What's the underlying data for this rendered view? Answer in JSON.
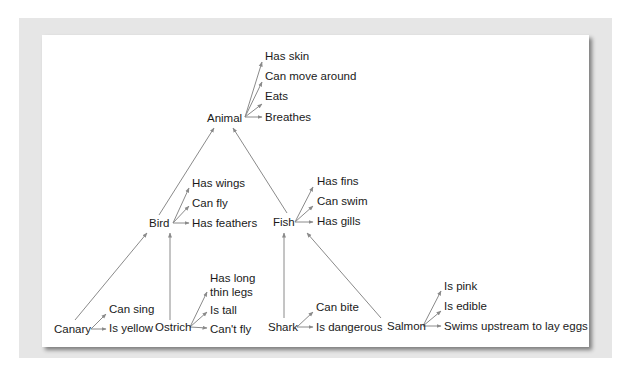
{
  "colors": {
    "frame": "#e6e6e6",
    "panel": "#ffffff",
    "arrow": "#8a8a8a",
    "text": "#1a1a1a"
  },
  "nodes": {
    "animal": {
      "label": "Animal",
      "x": 207,
      "y": 118
    },
    "bird": {
      "label": "Bird",
      "x": 149,
      "y": 223
    },
    "fish": {
      "label": "Fish",
      "x": 273,
      "y": 222
    },
    "canary": {
      "label": "Canary",
      "x": 54,
      "y": 329
    },
    "ostrich": {
      "label": "Ostrich",
      "x": 155,
      "y": 327
    },
    "shark": {
      "label": "Shark",
      "x": 268,
      "y": 327
    },
    "salmon": {
      "label": "Salmon",
      "x": 387,
      "y": 326
    }
  },
  "properties": {
    "animal": [
      {
        "label": "Has skin",
        "x": 265,
        "y": 56
      },
      {
        "label": "Can move around",
        "x": 265,
        "y": 76
      },
      {
        "label": "Eats",
        "x": 265,
        "y": 96
      },
      {
        "label": "Breathes",
        "x": 265,
        "y": 117
      }
    ],
    "bird": [
      {
        "label": "Has wings",
        "x": 192,
        "y": 183
      },
      {
        "label": "Can fly",
        "x": 192,
        "y": 203
      },
      {
        "label": "Has feathers",
        "x": 192,
        "y": 223
      }
    ],
    "fish": [
      {
        "label": "Has fins",
        "x": 317,
        "y": 181
      },
      {
        "label": "Can swim",
        "x": 317,
        "y": 201
      },
      {
        "label": "Has gills",
        "x": 317,
        "y": 221
      }
    ],
    "canary": [
      {
        "label": "Can sing",
        "x": 109,
        "y": 309
      },
      {
        "label": "Is yellow",
        "x": 109,
        "y": 328
      }
    ],
    "ostrich": [
      {
        "label": "Has long",
        "x": 210,
        "y": 278
      },
      {
        "label": "thin legs",
        "x": 210,
        "y": 292
      },
      {
        "label": "Is tall",
        "x": 210,
        "y": 310
      },
      {
        "label": "Can't fly",
        "x": 210,
        "y": 329
      }
    ],
    "shark": [
      {
        "label": "Can bite",
        "x": 316,
        "y": 307
      },
      {
        "label": "Is dangerous",
        "x": 316,
        "y": 327
      }
    ],
    "salmon": [
      {
        "label": "Is pink",
        "x": 444,
        "y": 286
      },
      {
        "label": "Is edible",
        "x": 444,
        "y": 306
      },
      {
        "label": "Swims upstream to lay eggs",
        "x": 444,
        "y": 326
      }
    ]
  },
  "isa_edges": [
    {
      "from": "bird",
      "to": "animal",
      "x1": 159,
      "y1": 215,
      "x2": 214,
      "y2": 128
    },
    {
      "from": "fish",
      "to": "animal",
      "x1": 287,
      "y1": 213,
      "x2": 233,
      "y2": 128
    },
    {
      "from": "canary",
      "to": "bird",
      "x1": 75,
      "y1": 320,
      "x2": 147,
      "y2": 233
    },
    {
      "from": "ostrich",
      "to": "bird",
      "x1": 170,
      "y1": 320,
      "x2": 170,
      "y2": 233
    },
    {
      "from": "shark",
      "to": "fish",
      "x1": 284,
      "y1": 318,
      "x2": 284,
      "y2": 233
    },
    {
      "from": "salmon",
      "to": "fish",
      "x1": 381,
      "y1": 318,
      "x2": 307,
      "y2": 233
    }
  ],
  "property_edges": [
    {
      "node": "animal",
      "x1": 245,
      "y1": 117,
      "x2": 262,
      "y2": 62
    },
    {
      "node": "animal",
      "x1": 245,
      "y1": 117,
      "x2": 262,
      "y2": 82
    },
    {
      "node": "animal",
      "x1": 245,
      "y1": 117,
      "x2": 262,
      "y2": 104
    },
    {
      "node": "animal",
      "x1": 245,
      "y1": 117,
      "x2": 262,
      "y2": 117
    },
    {
      "node": "bird",
      "x1": 173,
      "y1": 223,
      "x2": 189,
      "y2": 188
    },
    {
      "node": "bird",
      "x1": 173,
      "y1": 223,
      "x2": 189,
      "y2": 206
    },
    {
      "node": "bird",
      "x1": 173,
      "y1": 223,
      "x2": 189,
      "y2": 223
    },
    {
      "node": "fish",
      "x1": 295,
      "y1": 222,
      "x2": 313,
      "y2": 187
    },
    {
      "node": "fish",
      "x1": 295,
      "y1": 222,
      "x2": 313,
      "y2": 206
    },
    {
      "node": "fish",
      "x1": 295,
      "y1": 222,
      "x2": 313,
      "y2": 222
    },
    {
      "node": "canary",
      "x1": 91,
      "y1": 329,
      "x2": 106,
      "y2": 314
    },
    {
      "node": "canary",
      "x1": 91,
      "y1": 329,
      "x2": 106,
      "y2": 329
    },
    {
      "node": "ostrich",
      "x1": 190,
      "y1": 327,
      "x2": 207,
      "y2": 292
    },
    {
      "node": "ostrich",
      "x1": 190,
      "y1": 327,
      "x2": 207,
      "y2": 312
    },
    {
      "node": "ostrich",
      "x1": 190,
      "y1": 327,
      "x2": 207,
      "y2": 328
    },
    {
      "node": "shark",
      "x1": 297,
      "y1": 327,
      "x2": 313,
      "y2": 312
    },
    {
      "node": "shark",
      "x1": 297,
      "y1": 327,
      "x2": 313,
      "y2": 327
    },
    {
      "node": "salmon",
      "x1": 423,
      "y1": 326,
      "x2": 441,
      "y2": 291
    },
    {
      "node": "salmon",
      "x1": 423,
      "y1": 326,
      "x2": 441,
      "y2": 311
    },
    {
      "node": "salmon",
      "x1": 423,
      "y1": 326,
      "x2": 441,
      "y2": 326
    }
  ]
}
